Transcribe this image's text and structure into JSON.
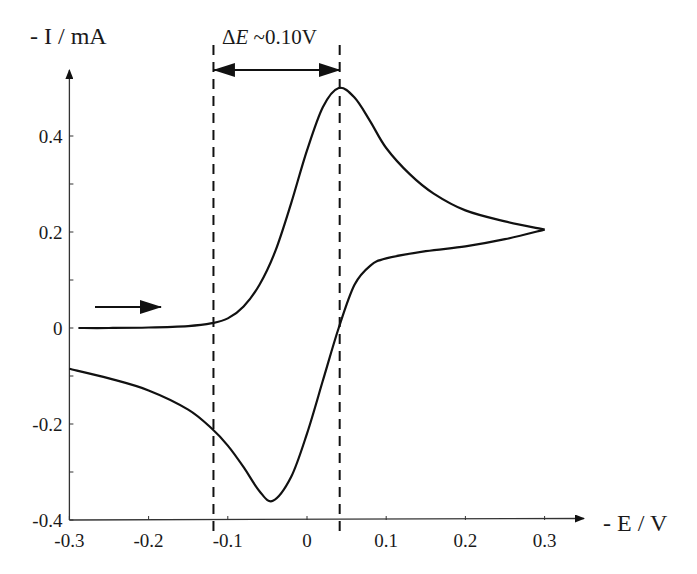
{
  "chart_data": {
    "type": "line",
    "title": "",
    "xlabel": "- E / V",
    "ylabel": "- I / mA",
    "xlim": [
      -0.3,
      0.35
    ],
    "ylim": [
      -0.4,
      0.5
    ],
    "x_ticks": [
      -0.3,
      -0.2,
      -0.1,
      0,
      0.1,
      0.2,
      0.3
    ],
    "x_tick_labels": [
      "-0.3",
      "-0.2",
      "-0.1",
      "0",
      "0.1",
      "0.2",
      "0.3"
    ],
    "y_ticks": [
      -0.4,
      -0.3,
      -0.2,
      -0.1,
      0,
      0.1,
      0.2,
      0.3,
      0.4
    ],
    "y_tick_labels": [
      "-0.4",
      "",
      "-0.2",
      "",
      "0",
      "",
      "0.2",
      "",
      "0.4"
    ],
    "grid": false,
    "legend": null,
    "series": [
      {
        "name": "forward scan",
        "x": [
          -0.3,
          -0.25,
          -0.2,
          -0.15,
          -0.12,
          -0.1,
          -0.08,
          -0.06,
          -0.04,
          -0.02,
          0.0,
          0.02,
          0.04,
          0.06,
          0.08,
          0.1,
          0.13,
          0.16,
          0.2,
          0.25,
          0.3
        ],
        "y": [
          0.0,
          0.0,
          0.001,
          0.004,
          0.01,
          0.02,
          0.045,
          0.09,
          0.16,
          0.26,
          0.37,
          0.46,
          0.5,
          0.48,
          0.43,
          0.375,
          0.32,
          0.28,
          0.245,
          0.222,
          0.205
        ]
      },
      {
        "name": "reverse scan",
        "x": [
          0.3,
          0.25,
          0.2,
          0.15,
          0.1,
          0.08,
          0.06,
          0.04,
          0.02,
          0.0,
          -0.02,
          -0.043,
          -0.06,
          -0.08,
          -0.1,
          -0.12,
          -0.15,
          -0.2,
          -0.25,
          -0.3
        ],
        "y": [
          0.205,
          0.185,
          0.17,
          0.16,
          0.145,
          0.13,
          0.09,
          0.0,
          -0.11,
          -0.22,
          -0.31,
          -0.36,
          -0.34,
          -0.29,
          -0.245,
          -0.21,
          -0.17,
          -0.13,
          -0.105,
          -0.085
        ]
      }
    ],
    "annotations": [
      {
        "type": "dashed-vline",
        "x": -0.12
      },
      {
        "type": "dashed-vline",
        "x": 0.04
      },
      {
        "type": "double-arrow",
        "from": -0.12,
        "to": 0.04,
        "label": "ΔE ~0.10V"
      },
      {
        "type": "scan-direction-arrow",
        "direction": "right",
        "near": [
          -0.25,
          0.05
        ]
      }
    ],
    "peaks": {
      "anodic": {
        "E": 0.04,
        "I": 0.5
      },
      "cathodic": {
        "E": -0.043,
        "I": -0.36
      },
      "switching": {
        "E": 0.3,
        "I": 0.205
      }
    }
  },
  "labels": {
    "y_axis_title": "- I / mA",
    "x_axis_title": "- E / V",
    "delta_symbol": "Δ",
    "delta_var": "E",
    "delta_value": " ~0.10V"
  }
}
